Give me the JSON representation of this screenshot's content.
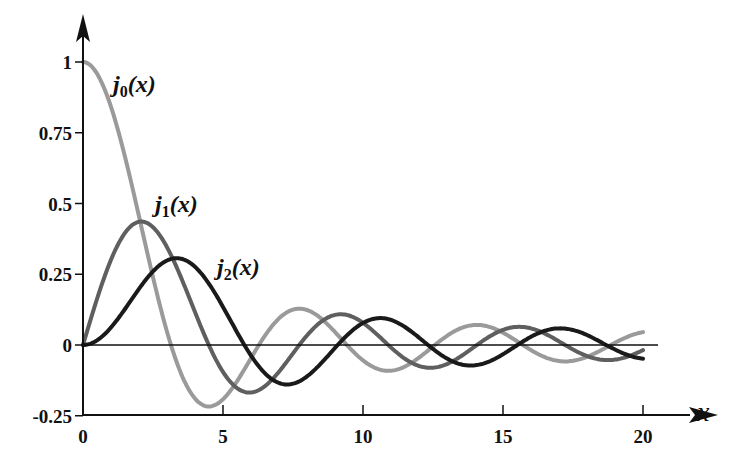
{
  "chart_data": {
    "type": "line",
    "title": "",
    "xlabel": "x",
    "ylabel": "",
    "xlim": [
      0,
      20
    ],
    "ylim": [
      -0.25,
      1
    ],
    "x_ticks": [
      "0",
      "5",
      "10",
      "15",
      "20"
    ],
    "y_ticks": [
      "1",
      "0.75",
      "0.5",
      "0.25",
      "0",
      "-0.25"
    ],
    "grid": false,
    "legend": "inline labels near curves",
    "series": [
      {
        "name": "j0(x)",
        "label_main": "j",
        "label_sub": "0",
        "label_rest": "(x)",
        "color": "#9a9a9a",
        "description": "spherical Bessel j0(x) = sin(x)/x",
        "key_points": [
          [
            0,
            1
          ],
          [
            3.14,
            0
          ],
          [
            4.49,
            -0.217
          ],
          [
            6.28,
            0
          ],
          [
            7.73,
            0.128
          ],
          [
            9.42,
            0
          ],
          [
            10.9,
            -0.091
          ],
          [
            12.57,
            0
          ],
          [
            14.07,
            0.071
          ],
          [
            20,
            0.046
          ]
        ]
      },
      {
        "name": "j1(x)",
        "label_main": "j",
        "label_sub": "1",
        "label_rest": "(x)",
        "color": "#5f5f5f",
        "description": "spherical Bessel j1(x)",
        "key_points": [
          [
            0,
            0
          ],
          [
            2.08,
            0.436
          ],
          [
            4.49,
            0
          ],
          [
            5.94,
            -0.168
          ],
          [
            7.73,
            0
          ],
          [
            9.21,
            0.113
          ],
          [
            10.9,
            0
          ],
          [
            12.4,
            -0.085
          ],
          [
            20,
            -0.021
          ]
        ]
      },
      {
        "name": "j2(x)",
        "label_main": "j",
        "label_sub": "2",
        "label_rest": "(x)",
        "color": "#1a1a1a",
        "description": "spherical Bessel j2(x)",
        "key_points": [
          [
            0,
            0
          ],
          [
            3.34,
            0.307
          ],
          [
            5.76,
            0
          ],
          [
            7.33,
            -0.134
          ],
          [
            9.1,
            0
          ],
          [
            10.6,
            0.105
          ],
          [
            12.3,
            0
          ],
          [
            20,
            -0.051
          ]
        ]
      }
    ]
  }
}
